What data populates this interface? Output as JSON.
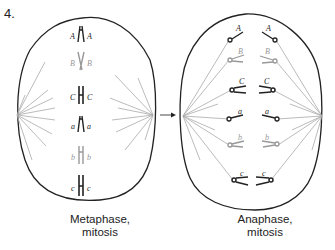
{
  "figure": {
    "number": "4.",
    "left_panel": {
      "caption_line1": "Metaphase,",
      "caption_line2": "mitosis",
      "chromosomes": [
        {
          "left_label": "A",
          "right_label": "A",
          "shade": "dark"
        },
        {
          "left_label": "B",
          "right_label": "B",
          "shade": "light"
        },
        {
          "left_label": "C",
          "right_label": "C",
          "shade": "dark"
        },
        {
          "left_label": "a",
          "right_label": "a",
          "shade": "dark"
        },
        {
          "left_label": "b",
          "right_label": "b",
          "shade": "light"
        },
        {
          "left_label": "c",
          "right_label": "c",
          "shade": "dark"
        }
      ]
    },
    "right_panel": {
      "caption_line1": "Anaphase,",
      "caption_line2": "mitosis",
      "chromosomes": [
        {
          "left_label": "A",
          "right_label": "A",
          "shade": "dark"
        },
        {
          "left_label": "B",
          "right_label": "B",
          "shade": "light"
        },
        {
          "left_label": "C",
          "right_label": "C",
          "shade": "dark"
        },
        {
          "left_label": "a",
          "right_label": "a",
          "shade": "dark"
        },
        {
          "left_label": "b",
          "right_label": "b",
          "shade": "light"
        },
        {
          "left_label": "c",
          "right_label": "c",
          "shade": "dark"
        }
      ]
    },
    "arrow": "right-arrow",
    "colors": {
      "dark": "#222222",
      "light": "#999999",
      "spindle": "#aaaaaa"
    }
  }
}
